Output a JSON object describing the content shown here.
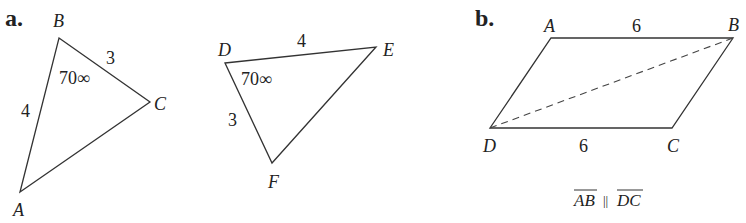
{
  "part_a": {
    "label": "a.",
    "triangle_abc": {
      "vertices": {
        "A": "A",
        "B": "B",
        "C": "C"
      },
      "sides": {
        "AB": "4",
        "BC": "3"
      },
      "angle_B": "70∞"
    },
    "triangle_def": {
      "vertices": {
        "D": "D",
        "E": "E",
        "F": "F"
      },
      "sides": {
        "DE": "4",
        "DF": "3"
      },
      "angle_D": "70∞"
    }
  },
  "part_b": {
    "label": "b.",
    "parallelogram": {
      "vertices": {
        "A": "A",
        "B": "B",
        "C": "C",
        "D": "D"
      },
      "sides": {
        "AB": "6",
        "DC": "6"
      },
      "diagonal": "DB (dashed)"
    },
    "caption": {
      "left": "AB",
      "mid": "||",
      "right": "DC"
    }
  }
}
